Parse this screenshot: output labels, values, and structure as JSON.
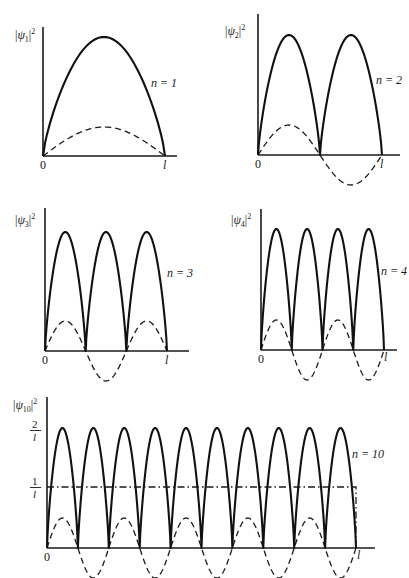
{
  "figure": {
    "background": "#ffffff",
    "ink": "#1a1a1a"
  },
  "chart_data": [
    {
      "type": "line",
      "title": "",
      "ylabel": "|ψ1|²",
      "ylabel_parts": {
        "psi": "ψ",
        "sub": "1",
        "sup": "2"
      },
      "xlabel": "",
      "x_ticks": [
        "0",
        "l"
      ],
      "annotation": "n = 1",
      "n": 1,
      "series": [
        {
          "name": "|ψ1|² (probability density)",
          "style": "solid",
          "formula": "(2/l) sin²(πx/l)",
          "peak_relative": 1.0
        },
        {
          "name": "ψ1 (wavefunction)",
          "style": "dashed",
          "formula": "sqrt(2/l) sin(πx/l)",
          "peak_relative": 0.25
        }
      ],
      "geometry": {
        "x0": 43,
        "x1": 165,
        "axis_end": 177,
        "y_base": 156,
        "y_top": 27,
        "peak_y": 37,
        "dash_amp": 29
      }
    },
    {
      "type": "line",
      "title": "",
      "ylabel": "|ψ2|²",
      "ylabel_parts": {
        "psi": "ψ",
        "sub": "2",
        "sup": "2"
      },
      "xlabel": "",
      "x_ticks": [
        "0",
        "l"
      ],
      "annotation": "n = 2",
      "n": 2,
      "series": [
        {
          "name": "|ψ2|² (probability density)",
          "style": "solid",
          "formula": "(2/l) sin²(2πx/l)",
          "peak_relative": 1.0
        },
        {
          "name": "ψ2 (wavefunction)",
          "style": "dashed",
          "formula": "sqrt(2/l) sin(2πx/l)",
          "peak_relative": 0.25
        }
      ],
      "geometry": {
        "x0": 258,
        "x1": 382,
        "axis_end": 400,
        "y_base": 155,
        "y_top": 14,
        "peak_y": 35,
        "dash_amp": 30
      }
    },
    {
      "type": "line",
      "title": "",
      "ylabel": "|ψ3|²",
      "ylabel_parts": {
        "psi": "ψ",
        "sub": "3",
        "sup": "2"
      },
      "xlabel": "",
      "x_ticks": [
        "0",
        "l"
      ],
      "annotation": "n = 3",
      "n": 3,
      "series": [
        {
          "name": "|ψ3|² (probability density)",
          "style": "solid",
          "formula": "(2/l) sin²(3πx/l)",
          "peak_relative": 1.0
        },
        {
          "name": "ψ3 (wavefunction)",
          "style": "dashed",
          "formula": "sqrt(2/l) sin(3πx/l)",
          "peak_relative": 0.25
        }
      ],
      "geometry": {
        "x0": 45,
        "x1": 167,
        "axis_end": 189,
        "y_base": 351,
        "y_top": 208,
        "peak_y": 232,
        "dash_amp": 30
      }
    },
    {
      "type": "line",
      "title": "",
      "ylabel": "|ψ4|²",
      "ylabel_parts": {
        "psi": "ψ",
        "sub": "4",
        "sup": "2"
      },
      "xlabel": "",
      "x_ticks": [
        "0",
        "l"
      ],
      "annotation": "n = 4",
      "n": 4,
      "series": [
        {
          "name": "|ψ4|² (probability density)",
          "style": "solid",
          "formula": "(2/l) sin²(4πx/l)",
          "peak_relative": 1.0
        },
        {
          "name": "ψ4 (wavefunction)",
          "style": "dashed",
          "formula": "sqrt(2/l) sin(4πx/l)",
          "peak_relative": 0.25
        }
      ],
      "geometry": {
        "x0": 261,
        "x1": 384,
        "axis_end": 397,
        "y_base": 350,
        "y_top": 209,
        "peak_y": 229,
        "dash_amp": 30
      }
    },
    {
      "type": "line",
      "title": "",
      "ylabel": "|ψ10|²",
      "ylabel_parts": {
        "psi": "ψ",
        "sub": "10",
        "sup": "2"
      },
      "xlabel": "",
      "x_ticks": [
        "0",
        "l"
      ],
      "y_ticks": [
        {
          "num": "2",
          "den": "l",
          "value": "2/l"
        },
        {
          "num": "1",
          "den": "l",
          "value": "1/l"
        }
      ],
      "annotation": "n = 10",
      "n": 10,
      "series": [
        {
          "name": "|ψ10|² (probability density)",
          "style": "solid",
          "formula": "(2/l) sin²(10πx/l)",
          "peak_value": "2/l"
        },
        {
          "name": "ψ10 (wavefunction)",
          "style": "dashed",
          "formula": "sqrt(2/l) sin(10πx/l)",
          "peak_relative": 0.25
        },
        {
          "name": "classical probability density",
          "style": "dash-dot",
          "formula": "1/l (uniform on 0 ≤ x ≤ l)",
          "value": "1/l"
        }
      ],
      "geometry": {
        "x0": 47,
        "x1": 356,
        "axis_end": 375,
        "y_base": 548,
        "y_top": 397,
        "peak_y": 428,
        "dash_amp": 30,
        "classical_y": 487
      }
    }
  ]
}
